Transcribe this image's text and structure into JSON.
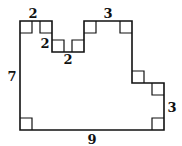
{
  "diagram": {
    "type": "rectilinear-polygon",
    "stroke_color": "#111111",
    "labels": {
      "top_left": "2",
      "notch_depth": "2",
      "notch_width": "2",
      "top_right": "3",
      "left_side": "7",
      "right_step": "3",
      "bottom": "9"
    }
  }
}
